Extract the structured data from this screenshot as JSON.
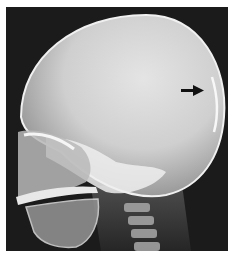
{
  "figure": {
    "annotation": {
      "type": "arrow",
      "direction": "right",
      "color": "#111111",
      "target": "occipital region"
    },
    "colors": {
      "border": "#ffffff",
      "background": "#1b1b1b",
      "cranium": "#d9d9d9",
      "bone_highlight": "#f2f2f2"
    }
  }
}
